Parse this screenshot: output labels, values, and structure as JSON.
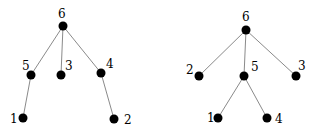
{
  "diagram": {
    "type": "trees",
    "trees": [
      {
        "id": "left-tree",
        "nodes": [
          {
            "label": "6",
            "x": 63,
            "y": 26,
            "lx": 58,
            "ly": 18
          },
          {
            "label": "5",
            "x": 31,
            "y": 75,
            "lx": 22,
            "ly": 70
          },
          {
            "label": "3",
            "x": 61,
            "y": 75,
            "lx": 65,
            "ly": 70
          },
          {
            "label": "4",
            "x": 101,
            "y": 73,
            "lx": 106,
            "ly": 68
          },
          {
            "label": "1",
            "x": 23,
            "y": 118,
            "lx": 10,
            "ly": 123
          },
          {
            "label": "2",
            "x": 114,
            "y": 119,
            "lx": 124,
            "ly": 124
          }
        ],
        "edges": [
          [
            "6",
            "5"
          ],
          [
            "6",
            "3"
          ],
          [
            "6",
            "4"
          ],
          [
            "5",
            "1"
          ],
          [
            "4",
            "2"
          ]
        ]
      },
      {
        "id": "right-tree",
        "nodes": [
          {
            "label": "6",
            "x": 246,
            "y": 30,
            "lx": 242,
            "ly": 21
          },
          {
            "label": "2",
            "x": 199,
            "y": 76,
            "lx": 186,
            "ly": 74
          },
          {
            "label": "5",
            "x": 244,
            "y": 76,
            "lx": 251,
            "ly": 71
          },
          {
            "label": "3",
            "x": 296,
            "y": 76,
            "lx": 298,
            "ly": 70
          },
          {
            "label": "1",
            "x": 218,
            "y": 118,
            "lx": 207,
            "ly": 122
          },
          {
            "label": "4",
            "x": 267,
            "y": 118,
            "lx": 275,
            "ly": 123
          }
        ],
        "edges": [
          [
            "6",
            "2"
          ],
          [
            "6",
            "5"
          ],
          [
            "6",
            "3"
          ],
          [
            "5",
            "1"
          ],
          [
            "5",
            "4"
          ]
        ]
      }
    ]
  }
}
